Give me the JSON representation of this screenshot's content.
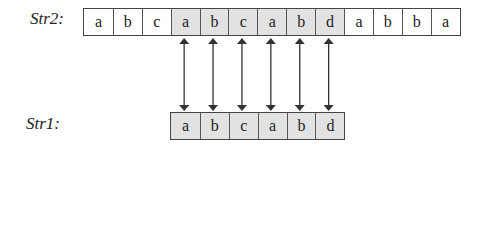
{
  "diagram": {
    "str2": {
      "label": "Str2:",
      "cells": [
        {
          "char": "a",
          "highlighted": false
        },
        {
          "char": "b",
          "highlighted": false
        },
        {
          "char": "c",
          "highlighted": false
        },
        {
          "char": "a",
          "highlighted": true
        },
        {
          "char": "b",
          "highlighted": true
        },
        {
          "char": "c",
          "highlighted": true
        },
        {
          "char": "a",
          "highlighted": true
        },
        {
          "char": "b",
          "highlighted": true
        },
        {
          "char": "d",
          "highlighted": true
        },
        {
          "char": "a",
          "highlighted": false
        },
        {
          "char": "b",
          "highlighted": false
        },
        {
          "char": "b",
          "highlighted": false
        },
        {
          "char": "a",
          "highlighted": false
        }
      ]
    },
    "str1": {
      "label": "Str1:",
      "cells": [
        {
          "char": "a",
          "highlighted": true
        },
        {
          "char": "b",
          "highlighted": true
        },
        {
          "char": "c",
          "highlighted": true
        },
        {
          "char": "a",
          "highlighted": true
        },
        {
          "char": "b",
          "highlighted": true
        },
        {
          "char": "d",
          "highlighted": true
        }
      ]
    },
    "match_offset": 3,
    "arrow_count": 6,
    "colors": {
      "highlight": "#e2e2e2",
      "border": "#444444",
      "text": "#222222"
    }
  }
}
